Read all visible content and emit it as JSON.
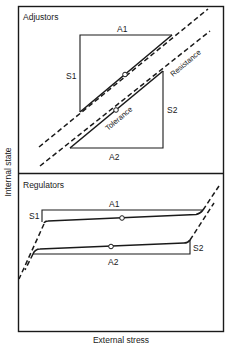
{
  "diagram": {
    "axes": {
      "y_label": "Internal state",
      "x_label": "External stress"
    },
    "panels": [
      {
        "title": "Adjustors",
        "labels": {
          "a1": "A1",
          "a2": "A2",
          "s1": "S1",
          "s2": "S2",
          "resistance": "Resistance",
          "tolerance": "Tolerance"
        }
      },
      {
        "title": "Regulators",
        "labels": {
          "a1": "A1",
          "a2": "A2",
          "s1": "S1",
          "s2": "S2"
        }
      }
    ],
    "colors": {
      "line": "#1a1a1a",
      "background": "#ffffff"
    }
  }
}
